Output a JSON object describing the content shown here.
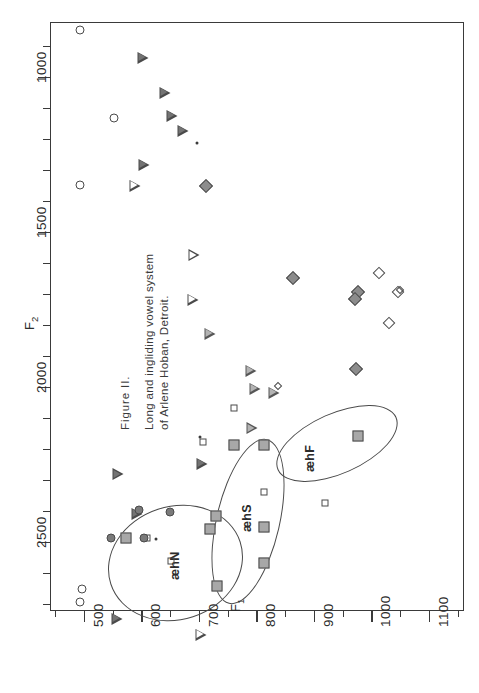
{
  "figure": {
    "caption_head": "Figure  II.",
    "caption_line1": "Long and ingliding vowel system",
    "caption_line2": "of Arlene Hoban, Detroit."
  },
  "axes": {
    "x_title": "F",
    "x_title_sub": "1",
    "y_title": "F",
    "y_title_sub": "2",
    "x_ticklabels": [
      "500",
      "600",
      "700",
      "800",
      "900",
      "1000",
      "1100"
    ],
    "y_ticklabels": [
      "1000",
      "1500",
      "2000",
      "2500"
    ]
  },
  "clusters": [
    {
      "label": "æhN"
    },
    {
      "label": "æhS"
    },
    {
      "label": "æhF"
    }
  ],
  "chart_data": {
    "type": "scatter",
    "title": "Long and ingliding vowel system of Arlene Hoban, Detroit.",
    "orientation": "rotated-90-ccw; F1 on horizontal axis increasing left-to-right, F2 on vertical axis increasing top-to-bottom",
    "xlabel": "F1",
    "ylabel": "F2",
    "xlim": [
      440,
      1160
    ],
    "ylim": [
      820,
      2720
    ],
    "x_ticks": [
      500,
      600,
      700,
      800,
      900,
      1000,
      1100
    ],
    "y_ticks": [
      1000,
      1500,
      2000,
      2500
    ],
    "grid": false,
    "legend": "none",
    "annotations": [
      {
        "text": "æhN",
        "x": 660,
        "y": 2430
      },
      {
        "text": "æhS",
        "x": 790,
        "y": 2290
      },
      {
        "text": "æhF",
        "x": 885,
        "y": 2160
      },
      {
        "text": "F1",
        "x": 745,
        "y": 2560
      }
    ],
    "series": [
      {
        "name": "open-circle",
        "marker": "circle-open",
        "points": [
          [
            492,
            845
          ],
          [
            552,
            1130
          ],
          [
            492,
            1345
          ],
          [
            496,
            2650
          ],
          [
            492,
            2690
          ]
        ]
      },
      {
        "name": "dark-triangle",
        "marker": "triangle-right-dark",
        "points": [
          [
            602,
            935
          ],
          [
            640,
            1010
          ],
          [
            652,
            1045
          ],
          [
            672,
            1055
          ],
          [
            604,
            1125
          ],
          [
            558,
            2085
          ],
          [
            592,
            2175
          ],
          [
            704,
            1975
          ],
          [
            556,
            2435
          ]
        ]
      },
      {
        "name": "open-triangle",
        "marker": "triangle-right-open",
        "points": [
          [
            588,
            1000
          ],
          [
            690,
            1185
          ],
          [
            688,
            1290
          ],
          [
            556,
            2655
          ],
          [
            654,
            2665
          ],
          [
            702,
            2255
          ]
        ]
      },
      {
        "name": "gray-triangle",
        "marker": "triangle-right-gray",
        "points": [
          [
            718,
            1245
          ],
          [
            790,
            1325
          ],
          [
            796,
            1345
          ],
          [
            830,
            1320
          ],
          [
            792,
            1395
          ]
        ]
      },
      {
        "name": "gray-diamond",
        "marker": "diamond-gray",
        "points": [
          [
            712,
            1350
          ],
          [
            862,
            1645
          ],
          [
            975,
            1690
          ],
          [
            970,
            1715
          ],
          [
            972,
            1940
          ]
        ]
      },
      {
        "name": "open-diamond",
        "marker": "diamond-open",
        "points": [
          [
            1012,
            1630
          ],
          [
            1045,
            1690
          ],
          [
            1030,
            1790
          ]
        ]
      },
      {
        "name": "small-open-diamond",
        "marker": "diamond-open-small",
        "points": [
          [
            836,
            1995
          ],
          [
            1048,
            1685
          ]
        ]
      },
      {
        "name": "gray-square",
        "marker": "square-gray",
        "points": [
          [
            572,
            2485
          ],
          [
            728,
            2415
          ],
          [
            718,
            2455
          ],
          [
            730,
            2640
          ],
          [
            760,
            2185
          ],
          [
            812,
            2185
          ],
          [
            812,
            2450
          ],
          [
            812,
            2565
          ],
          [
            975,
            2155
          ]
        ]
      },
      {
        "name": "open-square",
        "marker": "square-open",
        "points": [
          [
            760,
            2065
          ],
          [
            706,
            2175
          ],
          [
            608,
            2485
          ],
          [
            812,
            2335
          ],
          [
            650,
            2560
          ],
          [
            918,
            2370
          ]
        ]
      },
      {
        "name": "gray-circle",
        "marker": "circle-gray",
        "points": [
          [
            594,
            2395
          ],
          [
            648,
            2400
          ],
          [
            546,
            2485
          ],
          [
            604,
            2485
          ]
        ]
      },
      {
        "name": "dot",
        "marker": "dot",
        "points": [
          [
            700,
            2160
          ],
          [
            624,
            2487
          ],
          [
            696,
            1210
          ]
        ]
      }
    ]
  }
}
